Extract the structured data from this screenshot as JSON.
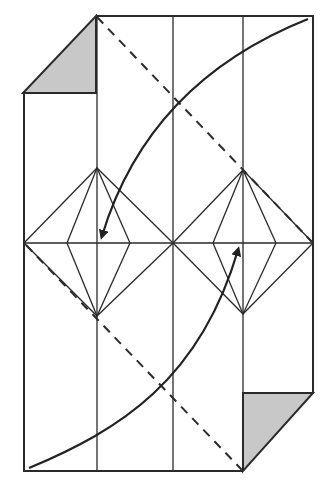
{
  "diagram": {
    "type": "origami-fold-diagram",
    "colors": {
      "line": "#2a2a2a",
      "shade": "#c8c8c8",
      "background": "#ffffff"
    },
    "elements": [
      {
        "name": "outer-paper-outline"
      },
      {
        "name": "vertical-crease-lines",
        "count": 3
      },
      {
        "name": "horizontal-center-crease"
      },
      {
        "name": "left-diamond-crease-pattern"
      },
      {
        "name": "right-diamond-crease-pattern"
      },
      {
        "name": "valley-fold-dashed-line-upper"
      },
      {
        "name": "valley-fold-dashed-line-lower"
      },
      {
        "name": "fold-arrow-upper-curve",
        "direction": "down-left"
      },
      {
        "name": "fold-arrow-lower-curve",
        "direction": "up-right"
      },
      {
        "name": "shaded-corner-top-left"
      },
      {
        "name": "shaded-corner-bottom-right"
      }
    ]
  }
}
